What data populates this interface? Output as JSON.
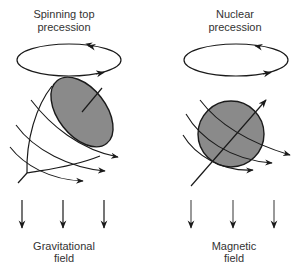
{
  "left_panel": {
    "title_line1": "Spinning top",
    "title_line2": "precession",
    "field_line1": "Gravitational",
    "field_line2": "field"
  },
  "right_panel": {
    "title_line1": "Nuclear",
    "title_line2": "precession",
    "field_line1": "Magnetic",
    "field_line2": "field"
  },
  "colors": {
    "stroke": "#1a1a1a",
    "fill_gray": "#8a8a8a",
    "text": "#333333"
  }
}
